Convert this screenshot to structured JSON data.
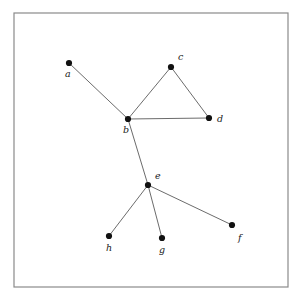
{
  "figure": {
    "background_color": "#ffffff",
    "frame": {
      "name": "figure-border",
      "x": 14,
      "y": 13,
      "width": 274,
      "height": 274,
      "stroke_color": "#8a8a8a",
      "stroke_width": 1.2,
      "fill": "#ffffff"
    },
    "style": {
      "edge_color": "#5a5a5a",
      "edge_width": 0.9,
      "node_color": "#111111",
      "node_radius": 3.1,
      "label_color": "#1a1a1a",
      "label_font_size": "9.5px"
    },
    "caption_artifact": ""
  },
  "graph": {
    "type": "undirected",
    "node_count": 8,
    "edge_count": 8,
    "nodes": [
      {
        "id": "a",
        "label": "a",
        "x": 69,
        "y": 63,
        "label_x": 65,
        "label_y": 77
      },
      {
        "id": "b",
        "label": "b",
        "x": 128,
        "y": 119,
        "label_x": 123,
        "label_y": 133
      },
      {
        "id": "c",
        "label": "c",
        "x": 171,
        "y": 67,
        "label_x": 178,
        "label_y": 60
      },
      {
        "id": "d",
        "label": "d",
        "x": 209,
        "y": 118,
        "label_x": 217,
        "label_y": 122
      },
      {
        "id": "e",
        "label": "e",
        "x": 148,
        "y": 185,
        "label_x": 155,
        "label_y": 179
      },
      {
        "id": "f",
        "label": "f",
        "x": 232,
        "y": 225,
        "label_x": 238,
        "label_y": 241
      },
      {
        "id": "g",
        "label": "g",
        "x": 162,
        "y": 238,
        "label_x": 159,
        "label_y": 253
      },
      {
        "id": "h",
        "label": "h",
        "x": 109,
        "y": 236,
        "label_x": 106,
        "label_y": 251
      }
    ],
    "edges": [
      {
        "id": "a-b",
        "source": "a",
        "target": "b"
      },
      {
        "id": "b-c",
        "source": "b",
        "target": "c"
      },
      {
        "id": "c-d",
        "source": "c",
        "target": "d"
      },
      {
        "id": "b-d",
        "source": "b",
        "target": "d"
      },
      {
        "id": "b-e",
        "source": "b",
        "target": "e"
      },
      {
        "id": "e-h",
        "source": "e",
        "target": "h"
      },
      {
        "id": "e-g",
        "source": "e",
        "target": "g"
      },
      {
        "id": "e-f",
        "source": "e",
        "target": "f"
      }
    ]
  }
}
